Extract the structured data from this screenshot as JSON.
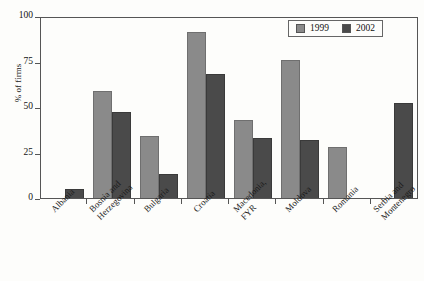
{
  "chart_data": {
    "type": "bar",
    "title": "",
    "xlabel": "",
    "ylabel": "% of firms",
    "ylim": [
      0,
      100
    ],
    "yticks": [
      0,
      25,
      50,
      75,
      100
    ],
    "grid": false,
    "legend_position": "top-right",
    "categories": [
      "Albania",
      "Bosnia and\nHerzegovina",
      "Bulgaria",
      "Croatia",
      "Macedonia,\nFYR",
      "Moldova",
      "Romania",
      "Serbia and\nMontenegro"
    ],
    "series": [
      {
        "name": "1999",
        "color": "#8a8a8a",
        "values": [
          null,
          59,
          34,
          91,
          43,
          76,
          28,
          null
        ]
      },
      {
        "name": "2002",
        "color": "#4a4a4a",
        "values": [
          5,
          47,
          13,
          68,
          33,
          32,
          null,
          52
        ]
      }
    ]
  }
}
